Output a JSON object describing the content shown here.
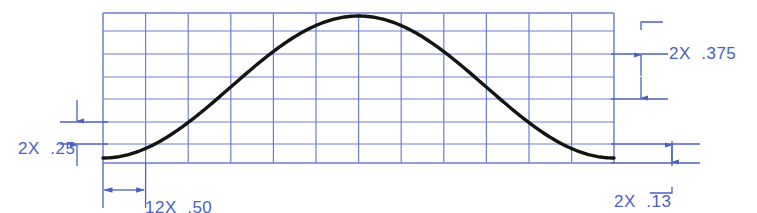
{
  "drawing": {
    "title": "Sinusoidal profile dimensioned engineering drawing",
    "colors": {
      "grid": "#6a7fd4",
      "dimension": "#4a5fc1",
      "curve": "#141414",
      "background": "#ffffff"
    },
    "grid": {
      "x_left": 103,
      "x_right": 614,
      "y_top": 13,
      "y_bottom": 163,
      "columns": 12,
      "rows": 7,
      "column_positions": [
        103,
        145.6,
        188.2,
        230.8,
        273.4,
        316,
        358.6,
        401.2,
        443.8,
        486.4,
        529,
        571.6,
        614
      ],
      "row_positions": [
        13,
        31,
        54,
        77,
        99,
        122,
        144,
        163
      ]
    },
    "curve": {
      "description": "bell / sinusoid profile",
      "peak_x": 358,
      "peak_y": 16,
      "start_x": 103,
      "start_y": 158,
      "end_x": 614,
      "end_y": 158,
      "stroke_width": 3.4
    },
    "dimensions": [
      {
        "id": "left-vertical",
        "label": "2X  .25",
        "label_prefix": "2X",
        "label_value": ".25",
        "orientation": "vertical",
        "text_x": 18,
        "text_y": 139,
        "ext_line_x_start": 60,
        "ext_line_x_end": 108,
        "upper_y": 122,
        "lower_y": 144,
        "arrow_x": 77,
        "arrows": "outside"
      },
      {
        "id": "right-upper-vertical",
        "label": "2X  .375",
        "label_prefix": "2X",
        "label_value": ".375",
        "orientation": "vertical",
        "text_x": 669,
        "text_y": 44,
        "ext_line_x_start": 611,
        "ext_line_x_end": 668,
        "upper_y": 54,
        "lower_y": 99,
        "arrow_x": 641,
        "leader": true,
        "arrows": "inside"
      },
      {
        "id": "right-lower-vertical",
        "label": "2X  .13",
        "label_prefix": "2X",
        "label_value": ".13",
        "orientation": "vertical",
        "text_x": 614,
        "text_y": 192,
        "ext_line_x_start": 611,
        "ext_line_x_end": 700,
        "upper_y": 144,
        "lower_y": 163,
        "arrow_x": 672,
        "leader": true,
        "arrows": "inside"
      },
      {
        "id": "bottom-horizontal",
        "label": "12X  .50",
        "label_prefix": "12X",
        "label_value": ".50",
        "orientation": "horizontal",
        "text_x": 145,
        "text_y": 198,
        "ext_x_left": 103,
        "ext_x_right": 145.6,
        "ext_y_top": 163,
        "ext_y_bottom": 208,
        "dim_line_y": 190,
        "arrows": "inside"
      }
    ]
  }
}
